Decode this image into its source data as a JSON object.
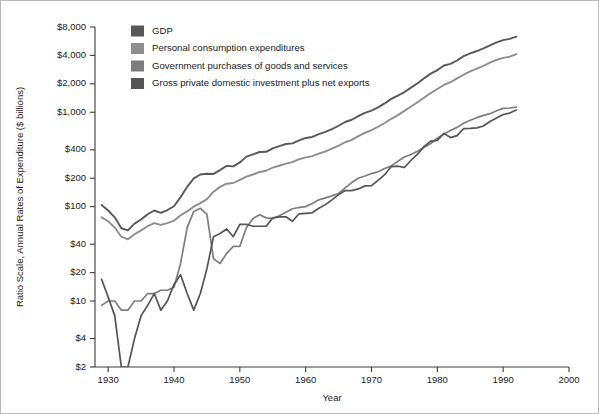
{
  "chart_data": {
    "type": "line",
    "title": "",
    "xlabel": "Year",
    "ylabel": "Ratio Scale, Annual Rates of Expenditure ($ billions)",
    "scale": "log",
    "grid": false,
    "legend_position": "top-left",
    "xlim": [
      1928,
      2000
    ],
    "ylim": [
      2,
      8000
    ],
    "xticks": [
      1930,
      1940,
      1950,
      1960,
      1970,
      1980,
      1990,
      2000
    ],
    "xticklabels": [
      "1930",
      "1940",
      "1950",
      "1960",
      "1970",
      "1980",
      "1990",
      "2000"
    ],
    "yticks": [
      2,
      4,
      10,
      20,
      40,
      100,
      200,
      400,
      1000,
      2000,
      4000,
      8000
    ],
    "yticklabels": [
      "$2",
      "$4",
      "$10",
      "$20",
      "$40",
      "$100",
      "$200",
      "$400",
      "$1,000",
      "$2,000",
      "$4,000",
      "$8,000"
    ],
    "x": [
      1929,
      1930,
      1931,
      1932,
      1933,
      1934,
      1935,
      1936,
      1937,
      1938,
      1939,
      1940,
      1941,
      1942,
      1943,
      1944,
      1945,
      1946,
      1947,
      1948,
      1949,
      1950,
      1951,
      1952,
      1953,
      1954,
      1955,
      1956,
      1957,
      1958,
      1959,
      1960,
      1961,
      1962,
      1963,
      1964,
      1965,
      1966,
      1967,
      1968,
      1969,
      1970,
      1971,
      1972,
      1973,
      1974,
      1975,
      1976,
      1977,
      1978,
      1979,
      1980,
      1981,
      1982,
      1983,
      1984,
      1985,
      1986,
      1987,
      1988,
      1989,
      1990,
      1991,
      1992
    ],
    "series": [
      {
        "name": "GDP",
        "color": "#585858",
        "values": [
          104,
          91,
          77,
          59,
          56,
          66,
          73,
          83,
          91,
          86,
          92,
          101,
          126,
          162,
          199,
          219,
          223,
          222,
          244,
          270,
          267,
          294,
          339,
          358,
          379,
          381,
          415,
          438,
          461,
          468,
          504,
          534,
          547,
          586,
          618,
          664,
          719,
          788,
          833,
          910,
          985,
          1039,
          1128,
          1240,
          1386,
          1501,
          1635,
          1824,
          2031,
          2295,
          2566,
          2795,
          3131,
          3259,
          3535,
          3933,
          4213,
          4453,
          4742,
          5108,
          5489,
          5803,
          5986,
          6319
        ]
      },
      {
        "name": "Personal consumption expenditures",
        "color": "#8e8e8e",
        "values": [
          77,
          70,
          60,
          48,
          45,
          51,
          56,
          62,
          67,
          64,
          67,
          71,
          81,
          89,
          100,
          109,
          120,
          144,
          162,
          175,
          178,
          192,
          208,
          219,
          233,
          240,
          259,
          271,
          286,
          296,
          318,
          332,
          343,
          364,
          384,
          412,
          444,
          481,
          509,
          559,
          604,
          648,
          702,
          770,
          852,
          932,
          1034,
          1152,
          1278,
          1430,
          1596,
          1762,
          1944,
          2079,
          2286,
          2498,
          2712,
          2896,
          3097,
          3351,
          3589,
          3761,
          3889,
          4136
        ]
      },
      {
        "name": "Government purchases of goods and services",
        "color": "#7d7d7d",
        "values": [
          9,
          10,
          10,
          8,
          8,
          10,
          10,
          12,
          12,
          13,
          13,
          14,
          25,
          60,
          89,
          96,
          83,
          28,
          25,
          32,
          38,
          38,
          60,
          75,
          82,
          76,
          75,
          80,
          87,
          95,
          98,
          100,
          108,
          118,
          124,
          130,
          138,
          158,
          180,
          200,
          211,
          224,
          234,
          254,
          270,
          302,
          335,
          356,
          387,
          425,
          467,
          530,
          588,
          641,
          691,
          766,
          824,
          876,
          927,
          966,
          1036,
          1098,
          1109,
          1132
        ]
      },
      {
        "name": "Gross private domestic investment plus net exports",
        "color": "#545454",
        "values": [
          17,
          11,
          7,
          2,
          2,
          4,
          7,
          9,
          12,
          8,
          10,
          15,
          19,
          12,
          8,
          12,
          22,
          48,
          52,
          58,
          48,
          65,
          65,
          62,
          62,
          62,
          76,
          78,
          78,
          70,
          84,
          85,
          86,
          96,
          105,
          118,
          134,
          148,
          148,
          154,
          166,
          167,
          190,
          218,
          266,
          268,
          260,
          310,
          360,
          435,
          495,
          503,
          597,
          539,
          566,
          670,
          675,
          683,
          715,
          798,
          868,
          947,
          980,
          1055
        ]
      }
    ]
  },
  "legend": {
    "items": [
      {
        "label": "GDP",
        "color": "#585858"
      },
      {
        "label": "Personal consumption expenditures",
        "color": "#8e8e8e"
      },
      {
        "label": "Government purchases of goods and services",
        "color": "#7d7d7d"
      },
      {
        "label": "Gross private domestic investment plus net exports",
        "color": "#545454"
      }
    ]
  },
  "axes": {
    "y_title": "Ratio Scale, Annual Rates of Expenditure ($ billions)",
    "x_title": "Year"
  }
}
